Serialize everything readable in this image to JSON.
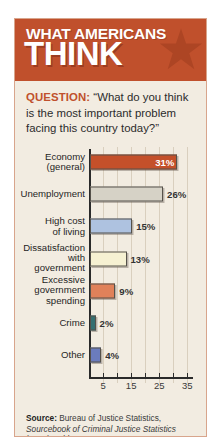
{
  "header": {
    "line1": "WHAT AMERICANS",
    "line2": "THINK",
    "background_color": "#c0502c",
    "star_color": "#a8insetno"
  },
  "question": {
    "label": "QUESTION:",
    "text": " “What do you think is the most important problem facing this country today?”"
  },
  "chart_data": {
    "type": "bar",
    "orientation": "horizontal",
    "title": "What Americans Think",
    "xlabel": "",
    "ylabel": "",
    "xlim": [
      0,
      37
    ],
    "grid": true,
    "legend": "none",
    "categories": [
      "Economy (general)",
      "Unemployment",
      "High cost of living",
      "Dissatisfaction with government",
      "Excessive government spending",
      "Crime",
      "Other"
    ],
    "values": [
      31,
      26,
      15,
      13,
      9,
      2,
      4
    ],
    "value_labels": [
      "31%",
      "26%",
      "15%",
      "13%",
      "9%",
      "2%",
      "4%"
    ],
    "bar_colors": [
      "#c4502a",
      "#d6d2c6",
      "#aec2e0",
      "#f6f1d2",
      "#e0815a",
      "#356f70",
      "#6b7cbd"
    ],
    "tick_values": [
      5,
      10,
      15,
      20,
      25,
      30,
      35
    ],
    "tick_labels": [
      {
        "value": 5,
        "label": "5"
      },
      {
        "value": 15,
        "label": "15"
      },
      {
        "value": 25,
        "label": "25"
      },
      {
        "value": 35,
        "label": "35"
      }
    ]
  },
  "rows": [
    {
      "label_line1": "Economy",
      "label_line2": "(general)",
      "value": "31%"
    },
    {
      "label_line1": "Unemployment",
      "label_line2": "",
      "value": "26%"
    },
    {
      "label_line1": "High cost",
      "label_line2": "of living",
      "value": "15%"
    },
    {
      "label_line1": "Dissatisfaction",
      "label_line2": "with",
      "label_line3": "government",
      "value": "13%"
    },
    {
      "label_line1": "Excessive",
      "label_line2": "government",
      "label_line3": "spending",
      "value": "9%"
    },
    {
      "label_line1": "Crime",
      "label_line2": "",
      "value": "2%"
    },
    {
      "label_line1": "Other",
      "label_line2": "",
      "value": "4%"
    }
  ],
  "source": {
    "label": "Source:",
    "line1": " Bureau of Justice Statistics,",
    "italic": "Sourcebook of Criminal Justice Statistics",
    "line2": "(2015), Table 2.1.2012."
  }
}
